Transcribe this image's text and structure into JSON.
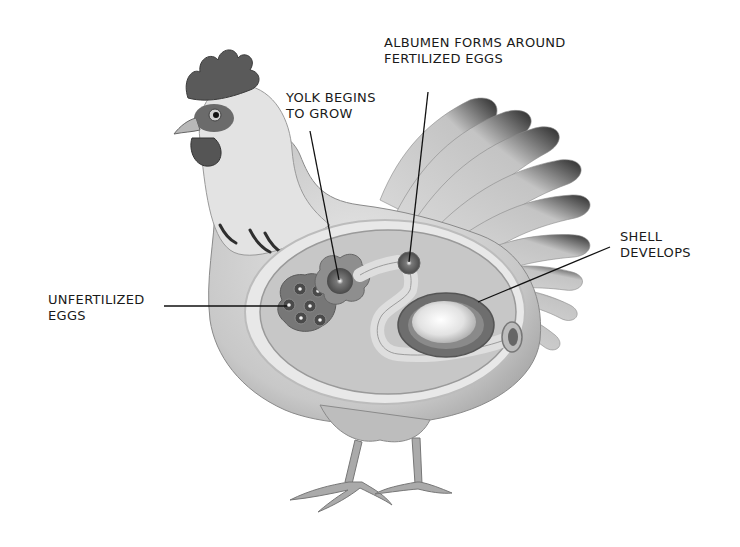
{
  "diagram": {
    "labels": [
      {
        "id": "albumen",
        "lines": [
          "ALBUMEN FORMS AROUND",
          "FERTILIZED EGGS"
        ]
      },
      {
        "id": "yolk",
        "lines": [
          "YOLK BEGINS",
          "TO GROW"
        ]
      },
      {
        "id": "shell",
        "lines": [
          "SHELL",
          "DEVELOPS"
        ]
      },
      {
        "id": "unfertilized",
        "lines": [
          "UNFERTILIZED",
          "EGGS"
        ]
      }
    ]
  },
  "colors": {
    "background": "#ffffff",
    "text": "#1a1a1a",
    "leader_line": "#111111",
    "body_light": "#d9d9d9",
    "body_mid": "#b5b5b5",
    "organ_cavity": "#c9c9c9",
    "comb": "#5a5a5a",
    "feather_tip": "#2a2a2a"
  }
}
